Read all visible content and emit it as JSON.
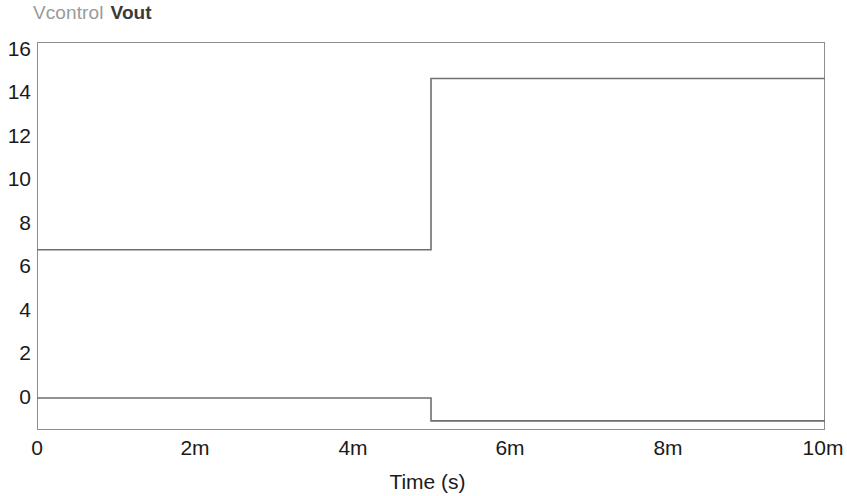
{
  "legend": {
    "entries": [
      {
        "label": "Vcontrol",
        "color": "#9a9a9a"
      },
      {
        "label": "Vout",
        "color": "#3a3a3a"
      }
    ],
    "vcontrol_label": "Vcontrol",
    "vout_label": "Vout"
  },
  "axes": {
    "x_title": "Time (s)",
    "x_ticks": [
      "0",
      "2m",
      "4m",
      "6m",
      "8m",
      "10m"
    ],
    "y_ticks": [
      "16",
      "14",
      "12",
      "10",
      "8",
      "6",
      "4",
      "2",
      "0"
    ]
  },
  "chart_data": {
    "type": "line",
    "title": "",
    "subtitle": "",
    "xlabel": "Time (s)",
    "ylabel": "",
    "xlim": [
      0,
      0.01
    ],
    "ylim": [
      -0.4,
      16.6
    ],
    "xtick_values": [
      0,
      0.002,
      0.004,
      0.006,
      0.008,
      0.01
    ],
    "xtick_labels": [
      "0",
      "2m",
      "4m",
      "6m",
      "8m",
      "10m"
    ],
    "ytick_values": [
      16,
      14,
      12,
      10,
      8,
      6,
      4,
      2,
      0
    ],
    "ytick_labels": [
      "16",
      "14",
      "12",
      "10",
      "8",
      "6",
      "4",
      "2",
      "0"
    ],
    "grid": false,
    "legend_position": "above-left",
    "series": [
      {
        "name": "Vout",
        "color": "#6f6f6f",
        "step": true,
        "x": [
          0,
          0.005,
          0.005,
          0.01
        ],
        "values": [
          7.5,
          7.5,
          15.0,
          15.0
        ],
        "low_level": 7.5,
        "high_level": 15.0,
        "transition_time": 0.005
      },
      {
        "name": "Vcontrol",
        "color": "#6f6f6f",
        "step": true,
        "x": [
          0,
          0.005,
          0.005,
          0.01
        ],
        "values": [
          1.0,
          1.0,
          0.0,
          0.0
        ],
        "low_level": 0.0,
        "high_level": 1.0,
        "transition_time": 0.005
      }
    ]
  }
}
